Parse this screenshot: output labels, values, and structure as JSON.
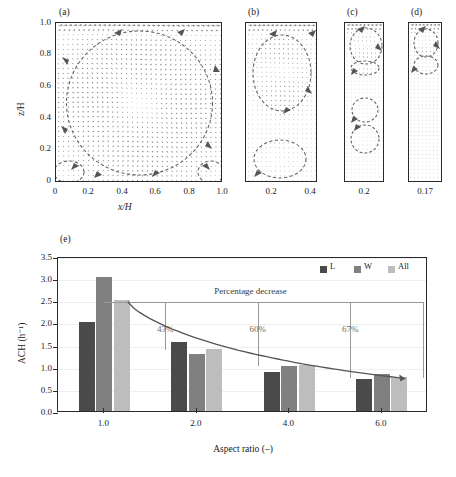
{
  "figure": {
    "panels": [
      {
        "id": "a",
        "label": "(a)",
        "xticks": [
          "0",
          "0.2",
          "0.4",
          "0.6",
          "0.8",
          "1.0"
        ],
        "yticks": [
          "0",
          "0.2",
          "0.4",
          "0.6",
          "0.8",
          "1.0"
        ],
        "xlabel": "x/H",
        "ylabel": "z/H",
        "aspect_ratio": 1.0,
        "vortices": [
          {
            "cx": 0.5,
            "cy": 0.5,
            "rx": 0.44,
            "ry": 0.45,
            "note": "main recirculation cell"
          },
          {
            "cx": 0.08,
            "cy": 0.07,
            "rx": 0.09,
            "ry": 0.07,
            "note": "bottom-left corner eddy"
          },
          {
            "cx": 0.93,
            "cy": 0.07,
            "rx": 0.08,
            "ry": 0.07,
            "note": "bottom-right corner eddy"
          }
        ]
      },
      {
        "id": "b",
        "label": "(b)",
        "xticks": [
          "0.2",
          "0.4"
        ],
        "aspect_ratio": 2.0,
        "vortices": [
          {
            "cx": 0.5,
            "cy": 0.69,
            "rx": 0.4,
            "ry": 0.24,
            "note": "upper cell"
          },
          {
            "cx": 0.47,
            "cy": 0.15,
            "rx": 0.36,
            "ry": 0.12,
            "note": "lower cell"
          }
        ]
      },
      {
        "id": "c",
        "label": "(c)",
        "xticks": [
          "0.2"
        ],
        "aspect_ratio": 4.0,
        "vortices": [
          {
            "cx": 0.52,
            "cy": 0.855,
            "rx": 0.4,
            "ry": 0.115,
            "note": "top driven cell"
          },
          {
            "cx": 0.5,
            "cy": 0.715,
            "rx": 0.36,
            "ry": 0.045,
            "note": "second cell"
          },
          {
            "cx": 0.5,
            "cy": 0.455,
            "rx": 0.33,
            "ry": 0.075,
            "note": "third cell"
          },
          {
            "cx": 0.5,
            "cy": 0.275,
            "rx": 0.36,
            "ry": 0.085,
            "note": "fourth cell"
          }
        ]
      },
      {
        "id": "d",
        "label": "(d)",
        "xticks": [
          "0.17"
        ],
        "aspect_ratio": 6.0,
        "vortices": [
          {
            "cx": 0.5,
            "cy": 0.875,
            "rx": 0.36,
            "ry": 0.09,
            "note": "top driven cell"
          },
          {
            "cx": 0.5,
            "cy": 0.735,
            "rx": 0.36,
            "ry": 0.06,
            "note": "second cell"
          }
        ]
      }
    ]
  },
  "chart_data": {
    "type": "bar",
    "label": "(e)",
    "title": "",
    "xlabel": "Aspect ratio (–)",
    "ylabel": "ACH (h⁻¹)",
    "categories": [
      "1.0",
      "2.0",
      "4.0",
      "6.0"
    ],
    "ylim": [
      0.0,
      3.5
    ],
    "yticks": [
      "0.0",
      "0.5",
      "1.0",
      "1.5",
      "2.0",
      "2.5",
      "3.0",
      "3.5"
    ],
    "grid": true,
    "legend_position": "top-right",
    "series": [
      {
        "name": "L",
        "color": "#4a4a4a",
        "values": [
          2.02,
          1.55,
          0.89,
          0.72
        ]
      },
      {
        "name": "W",
        "color": "#808080",
        "values": [
          3.02,
          1.28,
          1.02,
          0.83
        ]
      },
      {
        "name": "All",
        "color": "#bdbdbd",
        "values": [
          2.51,
          1.41,
          1.05,
          0.78
        ]
      }
    ],
    "annotation": "Percentage decrease",
    "percentage_decrease": [
      {
        "category": "2.0",
        "label": "43%"
      },
      {
        "category": "4.0",
        "label": "60%"
      },
      {
        "category": "6.0",
        "label": "67%"
      }
    ],
    "trend_curve": {
      "from_value": 2.51,
      "to_value": 0.78,
      "note": "decay curve from All(1.0) to All(6.0)"
    }
  }
}
